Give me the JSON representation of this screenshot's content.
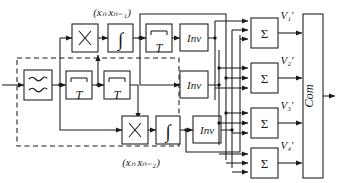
{
  "diagram": {
    "background": "#ffffff",
    "stroke": "#1a1a1a",
    "blocks": {
      "input_filter": {
        "name": "bandpass-filter",
        "symbol": "wavy-double"
      },
      "delay_1": {
        "label": "T"
      },
      "delay_2": {
        "label": "T"
      },
      "delay_3": {
        "label": "T"
      },
      "mult_1": {
        "label": "×"
      },
      "mult_2": {
        "label": "×"
      },
      "integ_1": {
        "label": "∫"
      },
      "integ_2": {
        "label": "∫"
      },
      "inv_1": {
        "label": "Inv"
      },
      "inv_2": {
        "label": "Inv"
      },
      "inv_3": {
        "label": "Inv"
      },
      "sum_1": {
        "label": "Σ"
      },
      "sum_2": {
        "label": "Σ"
      },
      "sum_3": {
        "label": "Σ"
      },
      "sum_4": {
        "label": "Σ"
      },
      "comparator": {
        "label": "Com"
      }
    },
    "annotations": {
      "product_top": "(xₙ xₙ₋₁)",
      "product_bottom": "(xₙ xₙ₋₂)",
      "v1": "V₁′",
      "v2": "V₂′",
      "v3": "V₃′",
      "v4": "V₄′"
    }
  }
}
